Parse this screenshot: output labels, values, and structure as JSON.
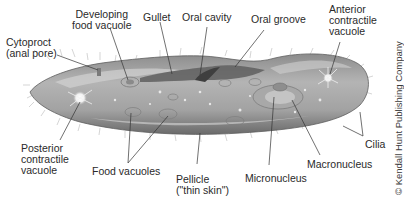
{
  "diagram": {
    "labels": {
      "developing_food_vacuole": [
        "Developing",
        "food vacuole"
      ],
      "gullet": "Gullet",
      "oral_cavity": "Oral cavity",
      "oral_groove": "Oral groove",
      "anterior_contractile_vacuole": [
        "Anterior",
        "contractile",
        "vacuole"
      ],
      "cytoproct": [
        "Cytoproct",
        "(anal pore)"
      ],
      "posterior_contractile_vacuole": [
        "Posterior",
        "contractile",
        "vacuole"
      ],
      "food_vacuoles": "Food vacuoles",
      "pellicle": [
        "Pellicle",
        "(\"thin skin\")"
      ],
      "micronucleus": "Micronucleus",
      "macronucleus": "Macronucleus",
      "cilia": "Cilia"
    },
    "credit": "© Kendall Hunt Publishing Company",
    "colors": {
      "body_fill": "#9a9a9a",
      "body_highlight": "#c8c8c8",
      "body_shadow": "#6e6e6e",
      "oral_groove": "#5c5c5c",
      "leader_line": "#333333",
      "text": "#2a2a2a"
    }
  }
}
